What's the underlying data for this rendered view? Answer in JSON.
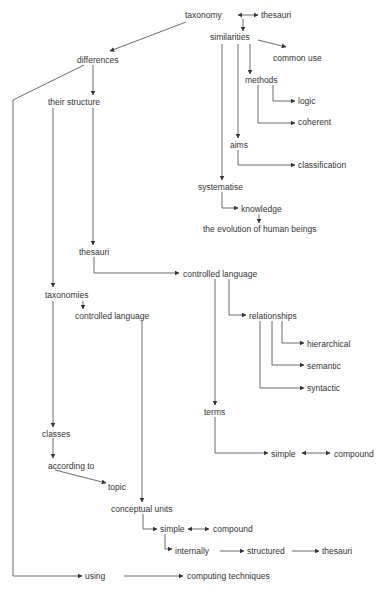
{
  "diagram": {
    "type": "concept-map",
    "nodes": [
      {
        "id": "taxonomy",
        "label": "taxonomy",
        "x": 185,
        "y": 15
      },
      {
        "id": "thesauri_top",
        "label": "thesauri",
        "x": 261,
        "y": 15
      },
      {
        "id": "similarities",
        "label": "similarities",
        "x": 210,
        "y": 37
      },
      {
        "id": "common_use",
        "label": "common use",
        "x": 273,
        "y": 58
      },
      {
        "id": "methods",
        "label": "methods",
        "x": 245,
        "y": 80
      },
      {
        "id": "logic",
        "label": "logic",
        "x": 298,
        "y": 101
      },
      {
        "id": "coherent",
        "label": "coherent",
        "x": 298,
        "y": 122
      },
      {
        "id": "aims",
        "label": "aims",
        "x": 230,
        "y": 145
      },
      {
        "id": "classification",
        "label": "classification",
        "x": 298,
        "y": 165
      },
      {
        "id": "systematise",
        "label": "systematise",
        "x": 198,
        "y": 187
      },
      {
        "id": "knowledge",
        "label": "knowledge",
        "x": 241,
        "y": 209
      },
      {
        "id": "evolution",
        "label": "the evolution of human beings",
        "x": 203,
        "y": 229
      },
      {
        "id": "differences",
        "label": "differences",
        "x": 77,
        "y": 60
      },
      {
        "id": "their_structure",
        "label": "their structure",
        "x": 48,
        "y": 102
      },
      {
        "id": "thesauri_mid",
        "label": "thesauri",
        "x": 79,
        "y": 252
      },
      {
        "id": "controlled_language_1",
        "label": "controlled language",
        "x": 183,
        "y": 274
      },
      {
        "id": "relationships",
        "label": "relationships",
        "x": 249,
        "y": 316
      },
      {
        "id": "hierarchical",
        "label": "hierarchical",
        "x": 307,
        "y": 344
      },
      {
        "id": "semantic",
        "label": "semantic",
        "x": 307,
        "y": 366
      },
      {
        "id": "syntactic",
        "label": "syntactic",
        "x": 307,
        "y": 388
      },
      {
        "id": "terms",
        "label": "terms",
        "x": 204,
        "y": 412
      },
      {
        "id": "simple_terms",
        "label": "simple",
        "x": 271,
        "y": 454
      },
      {
        "id": "compound_terms",
        "label": "compound",
        "x": 334,
        "y": 454
      },
      {
        "id": "taxonomies",
        "label": "taxonomies",
        "x": 45,
        "y": 295
      },
      {
        "id": "controlled_language_2",
        "label": "controlled language",
        "x": 75,
        "y": 316
      },
      {
        "id": "classes",
        "label": "classes",
        "x": 42,
        "y": 434
      },
      {
        "id": "according_to",
        "label": "according to",
        "x": 48,
        "y": 466
      },
      {
        "id": "topic",
        "label": "topic",
        "x": 108,
        "y": 487
      },
      {
        "id": "conceptual_units",
        "label": "conceptual units",
        "x": 111,
        "y": 509
      },
      {
        "id": "simple_cu",
        "label": "simple",
        "x": 160,
        "y": 529
      },
      {
        "id": "compound_cu",
        "label": "compound",
        "x": 213,
        "y": 529
      },
      {
        "id": "internally",
        "label": "internally",
        "x": 175,
        "y": 551
      },
      {
        "id": "structured",
        "label": "structured",
        "x": 247,
        "y": 551
      },
      {
        "id": "thesauri_bottom",
        "label": "thesauri",
        "x": 322,
        "y": 551
      },
      {
        "id": "using",
        "label": "using",
        "x": 85,
        "y": 576
      },
      {
        "id": "computing_techniques",
        "label": "computing techniques",
        "x": 187,
        "y": 576
      }
    ],
    "edges": [
      {
        "from": "taxonomy",
        "to": "thesauri_top",
        "bidirectional": true
      },
      {
        "from": "taxonomy",
        "to": "differences"
      },
      {
        "from": "taxonomy",
        "to": "similarities"
      },
      {
        "from": "similarities",
        "to": "common_use"
      },
      {
        "from": "similarities",
        "to": "methods"
      },
      {
        "from": "similarities",
        "to": "aims"
      },
      {
        "from": "similarities",
        "to": "systematise"
      },
      {
        "from": "methods",
        "to": "logic"
      },
      {
        "from": "methods",
        "to": "coherent"
      },
      {
        "from": "aims",
        "to": "classification"
      },
      {
        "from": "systematise",
        "to": "knowledge"
      },
      {
        "from": "knowledge",
        "to": "evolution"
      },
      {
        "from": "differences",
        "to": "their_structure"
      },
      {
        "from": "differences",
        "to": "using"
      },
      {
        "from": "their_structure",
        "to": "thesauri_mid"
      },
      {
        "from": "their_structure",
        "to": "taxonomies"
      },
      {
        "from": "thesauri_mid",
        "to": "controlled_language_1"
      },
      {
        "from": "controlled_language_1",
        "to": "relationships"
      },
      {
        "from": "controlled_language_1",
        "to": "terms"
      },
      {
        "from": "relationships",
        "to": "hierarchical"
      },
      {
        "from": "relationships",
        "to": "semantic"
      },
      {
        "from": "relationships",
        "to": "syntactic"
      },
      {
        "from": "terms",
        "to": "simple_terms"
      },
      {
        "from": "simple_terms",
        "to": "compound_terms",
        "bidirectional": true
      },
      {
        "from": "taxonomies",
        "to": "controlled_language_2"
      },
      {
        "from": "taxonomies",
        "to": "classes"
      },
      {
        "from": "controlled_language_2",
        "to": "conceptual_units"
      },
      {
        "from": "classes",
        "to": "according_to"
      },
      {
        "from": "according_to",
        "to": "topic"
      },
      {
        "from": "conceptual_units",
        "to": "simple_cu"
      },
      {
        "from": "simple_cu",
        "to": "compound_cu",
        "bidirectional": true
      },
      {
        "from": "simple_cu",
        "to": "internally"
      },
      {
        "from": "internally",
        "to": "structured"
      },
      {
        "from": "structured",
        "to": "thesauri_bottom"
      },
      {
        "from": "using",
        "to": "computing_techniques"
      }
    ]
  },
  "labels": {
    "taxonomy": "taxonomy",
    "thesauri_top": "thesauri",
    "similarities": "similarities",
    "common_use": "common use",
    "methods": "methods",
    "logic": "logic",
    "coherent": "coherent",
    "aims": "aims",
    "classification": "classification",
    "systematise": "systematise",
    "knowledge": "knowledge",
    "evolution": "the evolution of human beings",
    "differences": "differences",
    "their_structure": "their structure",
    "thesauri_mid": "thesauri",
    "controlled_language_1": "controlled language",
    "relationships": "relationships",
    "hierarchical": "hierarchical",
    "semantic": "semantic",
    "syntactic": "syntactic",
    "terms": "terms",
    "simple_terms": "simple",
    "compound_terms": "compound",
    "taxonomies": "taxonomies",
    "controlled_language_2": "controlled language",
    "classes": "classes",
    "according_to": "according to",
    "topic": "topic",
    "conceptual_units": "conceptual units",
    "simple_cu": "simple",
    "compound_cu": "compound",
    "internally": "internally",
    "structured": "structured",
    "thesauri_bottom": "thesauri",
    "using": "using",
    "computing_techniques": "computing techniques"
  },
  "colors": {
    "line": "#444444",
    "text": "#333333",
    "background": "#ffffff"
  }
}
